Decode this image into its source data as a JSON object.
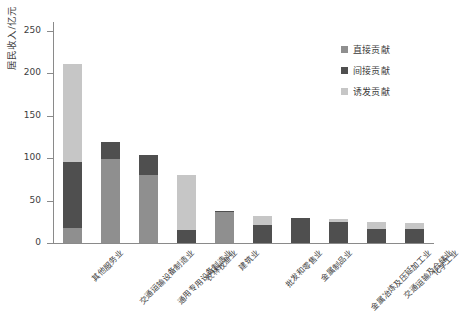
{
  "chart_data": {
    "type": "bar",
    "stacked": true,
    "title": "",
    "xlabel": "",
    "ylabel": "居民收入/亿元",
    "ylim": [
      0,
      260
    ],
    "yticks": [
      0,
      50,
      100,
      150,
      200,
      250
    ],
    "grid": false,
    "legend_position": "top-right",
    "categories": [
      "其他服务业",
      "交通运输设备制造业",
      "通用专用设备制造业",
      "农林牧渔业",
      "建筑业",
      "批发和零售业",
      "金属制品业",
      "金属冶炼及压延加工业",
      "交通运输及仓储业",
      "化学工业"
    ],
    "series": [
      {
        "name": "直接贡献",
        "color": "#8f8f8f",
        "values": [
          18,
          99,
          80,
          0,
          37,
          0,
          0,
          0,
          0,
          0
        ]
      },
      {
        "name": "间接贡献",
        "color": "#4f4f4f",
        "values": [
          77,
          20,
          23,
          15,
          1,
          21,
          29,
          25,
          17,
          17
        ]
      },
      {
        "name": "诱发贡献",
        "color": "#c6c6c6",
        "values": [
          116,
          0,
          0,
          65,
          0,
          11,
          1,
          3,
          8,
          6
        ]
      }
    ],
    "totals": [
      211,
      119,
      103,
      80,
      38,
      32,
      30,
      28,
      25,
      23
    ]
  },
  "legend": {
    "items": [
      {
        "label": "直接贡献",
        "color": "#8f8f8f"
      },
      {
        "label": "间接贡献",
        "color": "#4f4f4f"
      },
      {
        "label": "诱发贡献",
        "color": "#c6c6c6"
      }
    ]
  },
  "axes": {
    "y_label": "居民收入/亿元",
    "y_ticks": [
      "250",
      "200",
      "150",
      "100",
      "50",
      "0"
    ]
  }
}
